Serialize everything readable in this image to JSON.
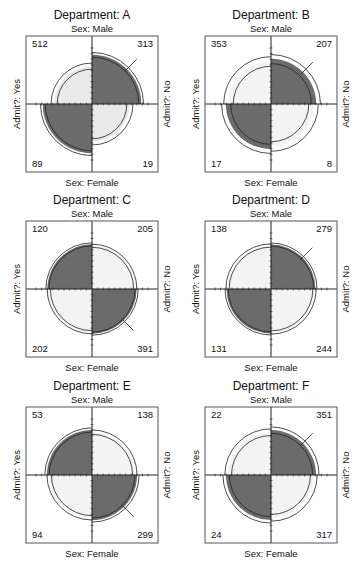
{
  "chart_data": {
    "type": "fourfold",
    "title_prefix": "Department: ",
    "row_variable": "Sex",
    "column_variable": "Admit?",
    "row_labels": {
      "top": "Sex: Male",
      "bottom": "Sex: Female"
    },
    "column_labels": {
      "left": "Admit?: Yes",
      "right": "Admit?: No"
    },
    "cell_order": [
      "Male-Yes",
      "Male-No",
      "Female-Yes",
      "Female-No"
    ],
    "colors": {
      "positive_association": "#6b6b6b",
      "negative_association_light": "#e9e9e9",
      "faint_light": "#f3f3f3",
      "ring": "#222222",
      "frame": "#555555"
    },
    "panels": [
      {
        "department": "A",
        "title": "Department: A",
        "counts": [
          512,
          313,
          89,
          19
        ]
      },
      {
        "department": "B",
        "title": "Department: B",
        "counts": [
          353,
          207,
          17,
          8
        ]
      },
      {
        "department": "C",
        "title": "Department: C",
        "counts": [
          120,
          205,
          202,
          391
        ]
      },
      {
        "department": "D",
        "title": "Department: D",
        "counts": [
          138,
          279,
          131,
          244
        ]
      },
      {
        "department": "E",
        "title": "Department: E",
        "counts": [
          53,
          138,
          94,
          299
        ]
      },
      {
        "department": "F",
        "title": "Department: F",
        "counts": [
          22,
          351,
          24,
          317
        ]
      }
    ]
  }
}
